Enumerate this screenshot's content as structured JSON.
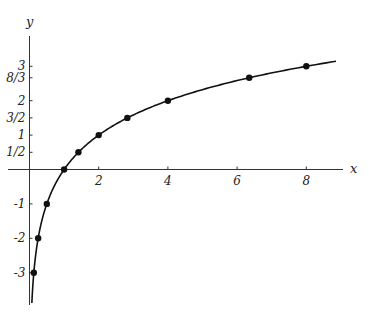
{
  "chart_data": {
    "type": "line",
    "title": "",
    "xlabel": "x",
    "ylabel": "y",
    "function": "y = log2(x)",
    "xlim": [
      0,
      9.1
    ],
    "ylim": [
      -3.8,
      3.8
    ],
    "grid": false,
    "x_ticks": [
      {
        "value": 2,
        "label": "2"
      },
      {
        "value": 4,
        "label": "4"
      },
      {
        "value": 6,
        "label": "6"
      },
      {
        "value": 8,
        "label": "8"
      }
    ],
    "y_ticks": [
      {
        "value": 3,
        "label": "3"
      },
      {
        "value": 2.6667,
        "label": "8/3"
      },
      {
        "value": 2,
        "label": "2"
      },
      {
        "value": 1.5,
        "label": "3/2"
      },
      {
        "value": 1,
        "label": "1"
      },
      {
        "value": 0.5,
        "label": "1/2"
      },
      {
        "value": -1,
        "label": "-1"
      },
      {
        "value": -2,
        "label": "-2"
      },
      {
        "value": -3,
        "label": "-3"
      }
    ],
    "points": [
      {
        "x": 0.125,
        "y": -3
      },
      {
        "x": 0.25,
        "y": -2
      },
      {
        "x": 0.5,
        "y": -1
      },
      {
        "x": 1,
        "y": 0
      },
      {
        "x": 1.414,
        "y": 0.5
      },
      {
        "x": 2,
        "y": 1
      },
      {
        "x": 2.828,
        "y": 1.5
      },
      {
        "x": 4,
        "y": 2
      },
      {
        "x": 6.35,
        "y": 2.6667
      },
      {
        "x": 8,
        "y": 3
      }
    ]
  },
  "axes": {
    "x_label": "x",
    "y_label": "y"
  }
}
